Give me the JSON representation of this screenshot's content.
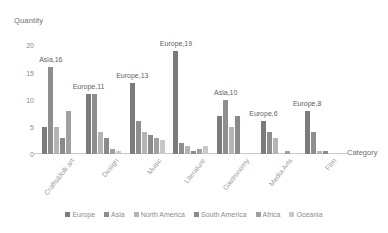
{
  "chart_data": {
    "type": "bar",
    "title": "",
    "xlabel": "Category",
    "ylabel": "Quantity",
    "ylim": [
      0,
      21
    ],
    "yticks": [
      0,
      5,
      10,
      15,
      20
    ],
    "ytick_labels": [
      "0",
      "5",
      "10",
      "15",
      "20"
    ],
    "grid": false,
    "legend_position": "bottom",
    "categories": [
      "Crafts&folk art",
      "Design",
      "Music",
      "Literature",
      "Gastronomy",
      "Media Arts",
      "Film"
    ],
    "series": [
      {
        "name": "Europe",
        "color": "#7b7b7b",
        "values": [
          5,
          11,
          13,
          19,
          7,
          6,
          8
        ]
      },
      {
        "name": "Asia",
        "color": "#8e8e8e",
        "values": [
          16,
          11,
          6,
          2,
          10,
          4,
          4
        ]
      },
      {
        "name": "North America",
        "color": "#b4b4b4",
        "values": [
          5,
          4,
          4,
          1.5,
          5,
          3,
          0.5
        ]
      },
      {
        "name": "South America",
        "color": "#8a8a8a",
        "values": [
          3,
          3,
          3.5,
          0.5,
          7,
          0,
          0.5
        ]
      },
      {
        "name": "Africa",
        "color": "#a0a0a0",
        "values": [
          8,
          1,
          3,
          1,
          0,
          0.5,
          0
        ]
      },
      {
        "name": "Oceania",
        "color": "#c8c8c8",
        "values": [
          0,
          0.5,
          2.5,
          1.5,
          0,
          0,
          0
        ]
      }
    ],
    "annotations": [
      {
        "text": "Asia,16",
        "category": "Crafts&folk art",
        "series": "Asia",
        "value": 16
      },
      {
        "text": "Europe,11",
        "category": "Design",
        "series": "Europe",
        "value": 11
      },
      {
        "text": "Europe,13",
        "category": "Music",
        "series": "Europe",
        "value": 13
      },
      {
        "text": "Europe,19",
        "category": "Literature",
        "series": "Europe",
        "value": 19
      },
      {
        "text": "Asia,10",
        "category": "Gastronomy",
        "series": "Asia",
        "value": 10
      },
      {
        "text": "Europe,6",
        "category": "Media Arts",
        "series": "Europe",
        "value": 6
      },
      {
        "text": "Europe,8",
        "category": "Film",
        "series": "Europe",
        "value": 8
      }
    ]
  }
}
